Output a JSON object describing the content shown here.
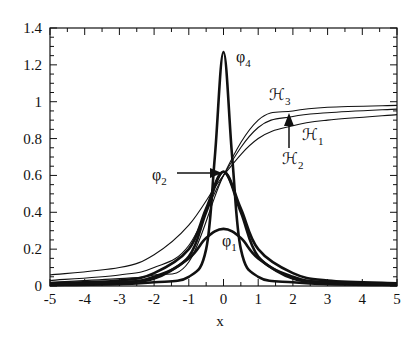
{
  "chart_data": {
    "type": "line",
    "title": "",
    "xlabel": "x",
    "ylabel": "",
    "xlim": [
      -5,
      5
    ],
    "ylim": [
      0,
      1.4
    ],
    "grid": false,
    "legend": "none (inline annotations)",
    "x_ticks": [
      "-5",
      "-4",
      "-3",
      "-2",
      "-1",
      "0",
      "1",
      "2",
      "3",
      "4",
      "5"
    ],
    "y_ticks": [
      "0",
      "0.2",
      "0.4",
      "0.6",
      "0.8",
      "1",
      "1.2",
      "1.4"
    ],
    "series": [
      {
        "name": "φ4",
        "style": "thick",
        "x": [
          -5,
          -3,
          -2,
          -1,
          -0.5,
          -0.25,
          0,
          0.25,
          0.5,
          1,
          2,
          3,
          5
        ],
        "values": [
          0.005,
          0.01,
          0.02,
          0.05,
          0.2,
          0.7,
          1.27,
          0.7,
          0.2,
          0.05,
          0.02,
          0.01,
          0.005
        ]
      },
      {
        "name": "φ3",
        "style": "thick",
        "x": [
          -5,
          -3,
          -2,
          -1,
          -0.5,
          0,
          0.5,
          1,
          2,
          3,
          5
        ],
        "values": [
          0.01,
          0.02,
          0.05,
          0.16,
          0.4,
          0.62,
          0.4,
          0.16,
          0.05,
          0.02,
          0.01
        ]
      },
      {
        "name": "φ2",
        "style": "thick",
        "x": [
          -5,
          -3,
          -2,
          -1,
          -0.5,
          0,
          0.5,
          1,
          2,
          3,
          5
        ],
        "values": [
          0.015,
          0.03,
          0.07,
          0.2,
          0.42,
          0.62,
          0.42,
          0.2,
          0.07,
          0.03,
          0.015
        ]
      },
      {
        "name": "φ1",
        "style": "thick",
        "x": [
          -5,
          -3,
          -2,
          -1,
          -0.5,
          0,
          0.5,
          1,
          2,
          3,
          5
        ],
        "values": [
          0.01,
          0.02,
          0.04,
          0.15,
          0.26,
          0.31,
          0.26,
          0.15,
          0.04,
          0.02,
          0.01
        ]
      },
      {
        "name": "ℋ1",
        "style": "thin",
        "x": [
          -5,
          -3,
          -2,
          -1,
          0,
          1,
          2,
          3,
          5
        ],
        "values": [
          0.06,
          0.1,
          0.17,
          0.33,
          0.6,
          0.8,
          0.87,
          0.9,
          0.93
        ]
      },
      {
        "name": "ℋ2",
        "style": "thin",
        "x": [
          -5,
          -3,
          -2,
          -1,
          0,
          1,
          2,
          3,
          5
        ],
        "values": [
          0.03,
          0.06,
          0.1,
          0.22,
          0.6,
          0.86,
          0.92,
          0.94,
          0.96
        ]
      },
      {
        "name": "ℋ3",
        "style": "thin",
        "x": [
          -5,
          -3,
          -2,
          -1,
          0,
          1,
          2,
          3,
          5
        ],
        "values": [
          0.02,
          0.04,
          0.06,
          0.13,
          0.6,
          0.9,
          0.95,
          0.97,
          0.98
        ]
      }
    ],
    "annotations": [
      {
        "text": "φ4",
        "x": 0.45,
        "y": 1.2
      },
      {
        "text": "ℋ3",
        "x": 1.3,
        "y": 0.97
      },
      {
        "text": "ℋ1",
        "x": 2.5,
        "y": 0.82
      },
      {
        "text": "ℋ2",
        "x": 1.6,
        "y": 0.7,
        "arrow_to": [
          1.9,
          0.95
        ]
      },
      {
        "text": "φ2",
        "x": -2.0,
        "y": 0.6,
        "arrow_to": [
          -0.05,
          0.62
        ]
      },
      {
        "text": "φ1",
        "x": 0.0,
        "y": 0.2
      }
    ]
  },
  "labels": {
    "xlabel": "x",
    "phi4": "φ",
    "phi4_sub": "4",
    "phi2": "φ",
    "phi2_sub": "2",
    "phi1": "φ",
    "phi1_sub": "1",
    "h3": "ℋ",
    "h3_sub": "3",
    "h1": "ℋ",
    "h1_sub": "1",
    "h2": "ℋ",
    "h2_sub": "2"
  }
}
